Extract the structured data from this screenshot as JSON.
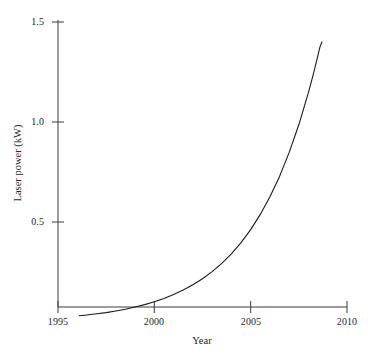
{
  "chart_data": {
    "type": "line",
    "title": "",
    "subtitle": "",
    "xlabel": "Year",
    "ylabel": "Laser power (kW)",
    "xlim": [
      1995,
      2010
    ],
    "ylim": [
      0.075,
      1.55
    ],
    "xticks": [
      1995,
      2000,
      2005,
      2010
    ],
    "xtick_labels": [
      "1995",
      "2000",
      "2005",
      "2010"
    ],
    "yticks": [
      0.5,
      1.0,
      1.5
    ],
    "ytick_labels": [
      "0.5",
      "1.0",
      "1.5"
    ],
    "grid": false,
    "legend": false,
    "legend_position": "none",
    "annotations": [],
    "series": [
      {
        "name": "Laser power",
        "color": "#1a1a1a",
        "line_width": 1.1,
        "x": [
          1996.1,
          1996.5,
          1997.0,
          1997.5,
          1998.0,
          1998.5,
          1999.0,
          1999.5,
          2000.0,
          2000.5,
          2001.0,
          2001.5,
          2002.0,
          2002.5,
          2003.0,
          2003.5,
          2004.0,
          2004.5,
          2005.0,
          2005.5,
          2006.0,
          2006.5,
          2007.0,
          2007.5,
          2008.0,
          2008.3,
          2008.6,
          2008.7
        ],
        "y": [
          0.031,
          0.035,
          0.041,
          0.047,
          0.055,
          0.064,
          0.075,
          0.087,
          0.101,
          0.118,
          0.137,
          0.16,
          0.186,
          0.216,
          0.252,
          0.293,
          0.341,
          0.397,
          0.462,
          0.538,
          0.626,
          0.728,
          0.848,
          0.986,
          1.148,
          1.257,
          1.377,
          1.4
        ]
      }
    ]
  },
  "axes": {
    "y_tick_0_label": "0.5",
    "y_tick_1_label": "1.0",
    "y_tick_2_label": "1.5",
    "x_tick_0_label": "1995",
    "x_tick_1_label": "2000",
    "x_tick_2_label": "2005",
    "x_tick_3_label": "2010",
    "x_axis_title": "Year",
    "y_axis_title": "Laser power (kW)"
  },
  "colors": {
    "background": "#ffffff",
    "axis": "#3a3a3a",
    "curve": "#1a1a1a",
    "text": "#262626"
  }
}
